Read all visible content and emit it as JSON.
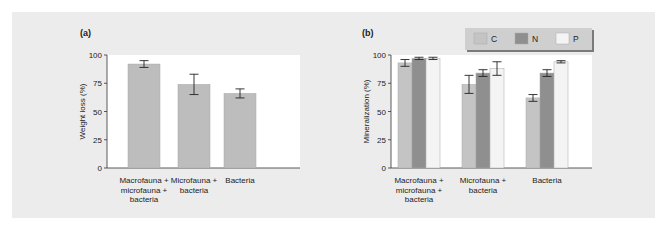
{
  "panels": {
    "a": {
      "label": "(a)"
    },
    "b": {
      "label": "(b)"
    }
  },
  "legend": {
    "items": [
      {
        "label": "C",
        "color": "#c4c4c4"
      },
      {
        "label": "N",
        "color": "#8f8f8f"
      },
      {
        "label": "P",
        "color": "#f4f4f4"
      }
    ]
  },
  "chart_data": [
    {
      "type": "bar",
      "title": "(a)",
      "xlabel": "",
      "ylabel": "Weight loss (%)",
      "ylim": [
        0,
        100
      ],
      "yticks": [
        0,
        25,
        50,
        75,
        100
      ],
      "categories": [
        "Macrofauna + microfauna + bacteria",
        "Microfauna + bacteria",
        "Bacteria"
      ],
      "category_lines": [
        [
          "Macrofauna +",
          "microfauna +",
          "bacteria"
        ],
        [
          "Microfauna +",
          "bacteria"
        ],
        [
          "Bacteria"
        ]
      ],
      "values": [
        92,
        74,
        66
      ],
      "errors": [
        3,
        9,
        4
      ],
      "color": "#bdbdbd",
      "grid": false
    },
    {
      "type": "bar",
      "title": "(b)",
      "xlabel": "",
      "ylabel": "Mineralization (%)",
      "ylim": [
        0,
        100
      ],
      "yticks": [
        0,
        25,
        50,
        75,
        100
      ],
      "categories": [
        "Macrofauna + microfauna + bacteria",
        "Microfauna + bacteria",
        "Bacteria"
      ],
      "category_lines": [
        [
          "Macrofauna +",
          "microfauna +",
          "bacteria"
        ],
        [
          "Microfauna +",
          "bacteria"
        ],
        [
          "Bacteria"
        ]
      ],
      "series": [
        {
          "name": "C",
          "values": [
            93,
            74,
            62
          ],
          "errors": [
            3,
            8,
            3
          ],
          "color": "#c4c4c4"
        },
        {
          "name": "N",
          "values": [
            97,
            84,
            84
          ],
          "errors": [
            1,
            3,
            3
          ],
          "color": "#8f8f8f"
        },
        {
          "name": "P",
          "values": [
            97,
            88,
            94
          ],
          "errors": [
            1,
            6,
            1
          ],
          "color": "#f4f4f4"
        }
      ],
      "legend_position": "top-right",
      "grid": false
    }
  ]
}
